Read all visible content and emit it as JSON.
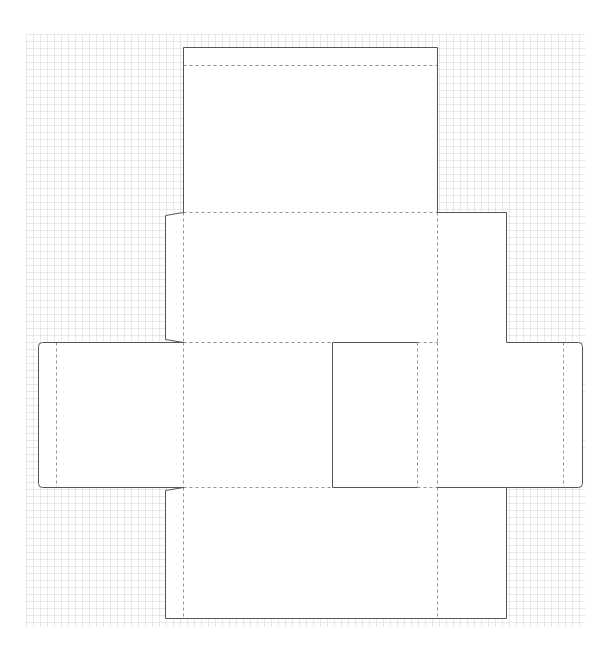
{
  "diagram": {
    "type": "box-dieline-template",
    "background": "#ffffff",
    "grid": {
      "x": 26,
      "y": 34,
      "width": 559,
      "height": 593,
      "spacing": 7,
      "color": "#c9c9c9"
    },
    "stroke": {
      "cut_color": "#555555",
      "fold_color": "#777777",
      "fold_dash": "3,3"
    },
    "panels": [
      {
        "name": "top-lid-panel",
        "x": 183,
        "y": 47,
        "w": 254,
        "h": 165
      },
      {
        "name": "back-panel",
        "x": 183,
        "y": 212,
        "w": 254,
        "h": 130
      },
      {
        "name": "back-side-flap",
        "x": 437,
        "y": 212,
        "w": 69,
        "h": 130
      },
      {
        "name": "left-side-flap",
        "x": 38,
        "y": 342,
        "w": 145,
        "h": 145
      },
      {
        "name": "base-panel",
        "x": 183,
        "y": 342,
        "w": 149,
        "h": 145
      },
      {
        "name": "front-panel",
        "x": 332,
        "y": 342,
        "w": 85,
        "h": 145
      },
      {
        "name": "glue-strip",
        "x": 417,
        "y": 342,
        "w": 20,
        "h": 145
      },
      {
        "name": "right-side-flap",
        "x": 437,
        "y": 342,
        "w": 145,
        "h": 145
      },
      {
        "name": "bottom-panel",
        "x": 183,
        "y": 487,
        "w": 254,
        "h": 131
      },
      {
        "name": "bottom-side-flap",
        "x": 437,
        "y": 487,
        "w": 69,
        "h": 131
      }
    ],
    "fold_lines": [
      {
        "name": "lid-tuck-fold",
        "x1": 183,
        "y1": 65,
        "x2": 437,
        "y2": 65
      },
      {
        "name": "lid-back-fold",
        "x1": 183,
        "y1": 212,
        "x2": 437,
        "y2": 212
      },
      {
        "name": "back-left-fold",
        "x1": 183,
        "y1": 212,
        "x2": 183,
        "y2": 342
      },
      {
        "name": "back-right-fold",
        "x1": 437,
        "y1": 212,
        "x2": 437,
        "y2": 342
      },
      {
        "name": "back-base-fold",
        "x1": 183,
        "y1": 342,
        "x2": 332,
        "y2": 342
      },
      {
        "name": "glue-top-fold",
        "x1": 417,
        "y1": 342,
        "x2": 437,
        "y2": 342
      },
      {
        "name": "left-flap-fold",
        "x1": 56,
        "y1": 342,
        "x2": 56,
        "y2": 487
      },
      {
        "name": "left-base-fold",
        "x1": 183,
        "y1": 342,
        "x2": 183,
        "y2": 487
      },
      {
        "name": "front-glue-fold",
        "x1": 417,
        "y1": 342,
        "x2": 417,
        "y2": 487
      },
      {
        "name": "glue-right-fold",
        "x1": 437,
        "y1": 342,
        "x2": 437,
        "y2": 487
      },
      {
        "name": "right-flap-fold",
        "x1": 563,
        "y1": 342,
        "x2": 563,
        "y2": 487
      },
      {
        "name": "base-bottom-fold",
        "x1": 183,
        "y1": 487,
        "x2": 332,
        "y2": 487
      },
      {
        "name": "glue-bottom-fold",
        "x1": 417,
        "y1": 487,
        "x2": 437,
        "y2": 487
      },
      {
        "name": "bottom-left-fold",
        "x1": 183,
        "y1": 487,
        "x2": 183,
        "y2": 618
      },
      {
        "name": "bottom-right-fold",
        "x1": 437,
        "y1": 487,
        "x2": 437,
        "y2": 618
      }
    ],
    "cut_path": "M183,47 L437,47 L437,212 L506,212 L506,342 L578,342 Q582,342 582,346 L582,483 Q582,487 578,487 L506,487 L506,618 L165,618 L165,490 L183,487 L42,487 Q38,487 38,483 L38,346 Q38,342 42,342 L183,342 L165,339 L165,215 L183,212 Z",
    "inner_cuts": [
      {
        "name": "front-panel-left-cut",
        "x1": 332,
        "y1": 342,
        "x2": 332,
        "y2": 487
      },
      {
        "name": "front-panel-top-cut",
        "x1": 332,
        "y1": 342,
        "x2": 417,
        "y2": 342
      },
      {
        "name": "front-panel-bottom-cut",
        "x1": 332,
        "y1": 487,
        "x2": 417,
        "y2": 487
      },
      {
        "name": "right-flap-bottom-cut",
        "x1": 437,
        "y1": 487,
        "x2": 506,
        "y2": 487
      }
    ]
  }
}
